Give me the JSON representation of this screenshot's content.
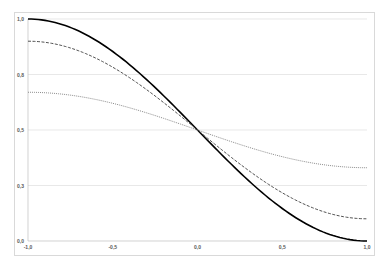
{
  "chart_data": {
    "type": "line",
    "title": "",
    "xlabel": "",
    "ylabel": "",
    "xlim": [
      -1.0,
      1.0
    ],
    "ylim": [
      0.0,
      1.0
    ],
    "grid": "horizontal",
    "legend": "none",
    "x_ticks": [
      "-1,0",
      "-0,5",
      "0,0",
      "0,5",
      "1,0"
    ],
    "y_ticks": [
      "0,0",
      "0,3",
      "0,5",
      "0,8",
      "1,0"
    ],
    "x": [
      -1.0,
      -0.75,
      -0.5,
      -0.25,
      0.0,
      0.25,
      0.5,
      0.75,
      1.0
    ],
    "series": [
      {
        "name": "solid",
        "style": "solid",
        "color": "#000000",
        "values": [
          1.0,
          0.96,
          0.85,
          0.69,
          0.5,
          0.31,
          0.15,
          0.04,
          0.0
        ]
      },
      {
        "name": "dashed",
        "style": "dashed",
        "color": "#404040",
        "values": [
          0.9,
          0.87,
          0.78,
          0.65,
          0.5,
          0.35,
          0.22,
          0.13,
          0.1
        ]
      },
      {
        "name": "dotted",
        "style": "dotted",
        "color": "#7f7f7f",
        "values": [
          0.67,
          0.66,
          0.62,
          0.57,
          0.5,
          0.43,
          0.38,
          0.34,
          0.33
        ]
      }
    ]
  }
}
